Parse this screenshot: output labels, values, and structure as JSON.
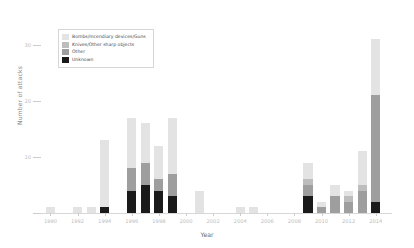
{
  "chart_data": {
    "type": "bar",
    "stacked": true,
    "title": "",
    "xlabel": "Year",
    "ylabel": "Number of attacks",
    "xlim": [
      1989.3,
      2015.2
    ],
    "ylim": [
      0,
      35.5
    ],
    "yticks": [
      0,
      10,
      20,
      30
    ],
    "ytick_labels": [
      "0",
      "10",
      "20",
      "30"
    ],
    "xticks": [
      1990,
      1992,
      1994,
      1996,
      1998,
      2000,
      2002,
      2004,
      2006,
      2008,
      2010,
      2012,
      2014
    ],
    "xtick_labels": [
      "1990",
      "1992",
      "1994",
      "1996",
      "1998",
      "2000",
      "2002",
      "2004",
      "2006",
      "2008",
      "2010",
      "2012",
      "2014"
    ],
    "grid": false,
    "legend_position": "upper left",
    "colors": {
      "bombs": "#e3e3e3",
      "knives": "#bdbdbd",
      "other": "#9e9e9e",
      "unknown": "#1a1a1a"
    },
    "series": [
      {
        "name": "Bombs/Incendiary devices/Guns",
        "color": "#e3e3e3",
        "values": [
          1,
          0,
          1,
          1,
          12,
          0,
          9,
          7,
          6,
          10,
          0,
          4,
          0,
          0,
          1,
          1,
          0,
          0,
          0,
          3,
          1,
          2,
          1,
          6,
          10
        ]
      },
      {
        "name": "Knives/Other sharp objects",
        "color": "#bdbdbd",
        "values": [
          0,
          0,
          0,
          0,
          0,
          0,
          0,
          0,
          0,
          0,
          0,
          0,
          0,
          0,
          0,
          0,
          0,
          0,
          0,
          1,
          0,
          0,
          1,
          1,
          0
        ]
      },
      {
        "name": "Other",
        "color": "#9e9e9e",
        "values": [
          0,
          0,
          0,
          0,
          0,
          0,
          4,
          4,
          2,
          4,
          0,
          0,
          0,
          0,
          0,
          0,
          0,
          0,
          0,
          2,
          1,
          3,
          2,
          4,
          19
        ]
      },
      {
        "name": "Unknown",
        "color": "#1a1a1a",
        "values": [
          0,
          0,
          0,
          0,
          1,
          0,
          4,
          5,
          4,
          3,
          0,
          0,
          0,
          0,
          0,
          0,
          0,
          0,
          0,
          3,
          0,
          0,
          0,
          0,
          2
        ]
      }
    ],
    "categories": [
      1990,
      1991,
      1992,
      1993,
      1994,
      1995,
      1996,
      1997,
      1998,
      1999,
      2000,
      2001,
      2002,
      2003,
      2004,
      2005,
      2006,
      2007,
      2008,
      2009,
      2010,
      2011,
      2012,
      2013,
      2014
    ],
    "totals": [
      1,
      0,
      1,
      1,
      13,
      0,
      17,
      16,
      12,
      17,
      0,
      4,
      0,
      0,
      1,
      1,
      0,
      0,
      0,
      9,
      2,
      5,
      4,
      11,
      31
    ]
  },
  "legend": {
    "items": [
      {
        "label": "Bombs/Incendiary devices/Guns"
      },
      {
        "label": "Knives/Other sharp objects"
      },
      {
        "label": "Other"
      },
      {
        "label": "Unknown"
      }
    ]
  }
}
